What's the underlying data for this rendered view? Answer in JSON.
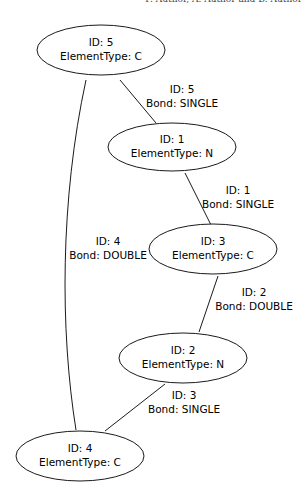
{
  "header": {
    "text": "F. Author, A. Author and B. Author"
  },
  "nodes": [
    {
      "id_label": "ID: 5",
      "type_label": "ElementType: C"
    },
    {
      "id_label": "ID: 1",
      "type_label": "ElementType: N"
    },
    {
      "id_label": "ID: 3",
      "type_label": "ElementType: C"
    },
    {
      "id_label": "ID: 2",
      "type_label": "ElementType: N"
    },
    {
      "id_label": "ID: 4",
      "type_label": "ElementType: C"
    }
  ],
  "edges": [
    {
      "id_label": "ID: 5",
      "bond_label": "Bond: SINGLE",
      "from": "5",
      "to": "1"
    },
    {
      "id_label": "ID: 1",
      "bond_label": "Bond: SINGLE",
      "from": "1",
      "to": "3"
    },
    {
      "id_label": "ID: 2",
      "bond_label": "Bond: DOUBLE",
      "from": "3",
      "to": "2"
    },
    {
      "id_label": "ID: 3",
      "bond_label": "Bond: SINGLE",
      "from": "2",
      "to": "4"
    },
    {
      "id_label": "ID: 4",
      "bond_label": "Bond: DOUBLE",
      "from": "5",
      "to": "4"
    }
  ]
}
